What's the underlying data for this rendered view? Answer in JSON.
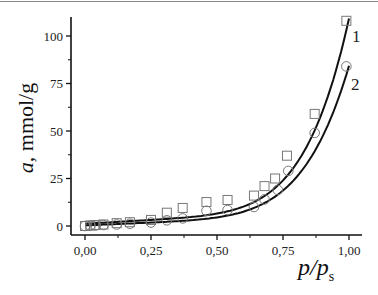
{
  "chart_data": {
    "type": "scatter",
    "title": "",
    "xlabel": "p/p_s",
    "xlabel_main": "p/p",
    "xlabel_sub": "s",
    "ylabel": "a, mmol/g",
    "ylabel_italic": "a",
    "ylabel_rest": ", mmol/g",
    "xlim": [
      -0.04,
      1.05
    ],
    "ylim": [
      -4,
      115
    ],
    "xticks": [
      0.0,
      0.25,
      0.5,
      0.75,
      1.0
    ],
    "xtick_labels": [
      "0,00",
      "0,25",
      "0,50",
      "0,75",
      "1,00"
    ],
    "yticks": [
      0,
      25,
      50,
      75,
      100
    ],
    "ytick_labels": [
      "0",
      "25",
      "50",
      "75",
      "100"
    ],
    "grid": false,
    "legend": "inline labels at curve ends",
    "series": [
      {
        "name": "1",
        "marker": "square",
        "fit_line": true,
        "x": [
          0.0,
          0.02,
          0.04,
          0.07,
          0.12,
          0.17,
          0.25,
          0.31,
          0.37,
          0.46,
          0.54,
          0.64,
          0.68,
          0.72,
          0.765,
          0.87,
          0.99
        ],
        "y": [
          0.0,
          0.3,
          0.5,
          0.8,
          1.5,
          2.0,
          3.2,
          7.0,
          9.5,
          12.6,
          13.7,
          16.0,
          21.0,
          25.0,
          37.0,
          59.0,
          108.0
        ]
      },
      {
        "name": "2",
        "marker": "circle",
        "fit_line": true,
        "x": [
          0.0,
          0.02,
          0.04,
          0.07,
          0.12,
          0.17,
          0.25,
          0.31,
          0.37,
          0.46,
          0.54,
          0.64,
          0.68,
          0.73,
          0.77,
          0.87,
          0.99
        ],
        "y": [
          0.0,
          0.2,
          0.3,
          0.5,
          0.8,
          1.2,
          1.8,
          3.0,
          4.0,
          8.0,
          8.4,
          10.0,
          14.0,
          19.0,
          29.0,
          49.0,
          84.0
        ]
      }
    ]
  }
}
